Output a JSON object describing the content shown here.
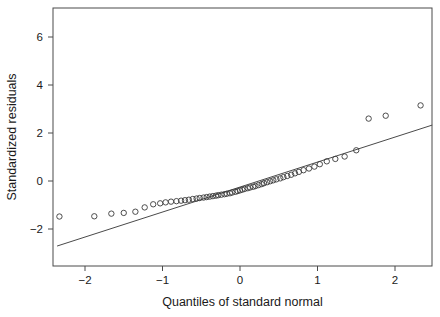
{
  "chart_data": {
    "type": "scatter",
    "title": "",
    "xlabel": "Quantiles of standard normal",
    "ylabel": "Standardized residuals",
    "xlim": [
      -2.41,
      2.48
    ],
    "ylim": [
      -2.92,
      7.21
    ],
    "xticks": [
      -2,
      -1,
      0,
      1,
      2
    ],
    "xticklabels": [
      "−2",
      "−1",
      "0",
      "1",
      "2"
    ],
    "yticks": [
      -2,
      0,
      2,
      4,
      6
    ],
    "yticklabels": [
      "−2",
      "0",
      "2",
      "4",
      "6"
    ],
    "grid": false,
    "legend": null,
    "marker": "open-circle",
    "reference_line": {
      "x": [
        -2.36,
        2.48
      ],
      "y": [
        -2.71,
        2.33
      ],
      "style": "solid"
    },
    "series": [
      {
        "name": "Standardized residuals vs normal quantiles",
        "x": [
          -2.33,
          -1.88,
          -1.66,
          -1.5,
          -1.35,
          -1.23,
          -1.12,
          -1.03,
          -0.96,
          -0.89,
          -0.82,
          -0.76,
          -0.71,
          -0.66,
          -0.61,
          -0.56,
          -0.52,
          -0.47,
          -0.43,
          -0.39,
          -0.35,
          -0.31,
          -0.28,
          -0.24,
          -0.2,
          -0.17,
          -0.13,
          -0.1,
          -0.06,
          -0.03,
          0.0,
          0.03,
          0.06,
          0.1,
          0.13,
          0.17,
          0.2,
          0.24,
          0.28,
          0.31,
          0.35,
          0.39,
          0.43,
          0.47,
          0.52,
          0.56,
          0.61,
          0.66,
          0.71,
          0.76,
          0.82,
          0.89,
          0.96,
          1.03,
          1.12,
          1.23,
          1.35,
          1.5,
          1.66,
          1.88,
          2.33
        ],
        "y": [
          -1.48,
          -1.47,
          -1.36,
          -1.33,
          -1.28,
          -1.1,
          -0.97,
          -0.93,
          -0.89,
          -0.86,
          -0.84,
          -0.82,
          -0.8,
          -0.78,
          -0.75,
          -0.73,
          -0.71,
          -0.69,
          -0.67,
          -0.65,
          -0.63,
          -0.61,
          -0.59,
          -0.57,
          -0.55,
          -0.53,
          -0.51,
          -0.48,
          -0.45,
          -0.42,
          -0.39,
          -0.36,
          -0.33,
          -0.3,
          -0.27,
          -0.24,
          -0.21,
          -0.17,
          -0.13,
          -0.09,
          -0.05,
          -0.01,
          0.03,
          0.07,
          0.11,
          0.16,
          0.21,
          0.26,
          0.32,
          0.38,
          0.45,
          0.52,
          0.6,
          0.7,
          0.82,
          0.92,
          1.02,
          1.28,
          2.6,
          2.72,
          3.15
        ]
      }
    ]
  }
}
